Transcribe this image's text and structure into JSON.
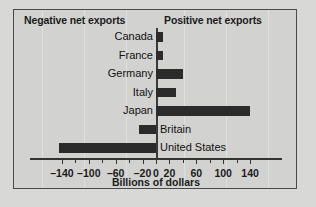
{
  "chart_data": {
    "type": "bar",
    "orientation": "horizontal",
    "title": "",
    "xlabel": "Billions of dollars",
    "ylabel": "",
    "xlim": [
      -150,
      150
    ],
    "grid": false,
    "legend": null,
    "categories": [
      "Canada",
      "France",
      "Germany",
      "Italy",
      "Japan",
      "Britain",
      "United States"
    ],
    "values": [
      10,
      10,
      40,
      30,
      140,
      -25,
      -145
    ],
    "tick_values": [
      -140,
      -100,
      -60,
      -20,
      0,
      20,
      60,
      100,
      140
    ],
    "tick_labels": [
      "–140",
      "–100",
      "–60",
      "–20",
      "0",
      "20",
      "60",
      "100",
      "140"
    ],
    "minor_tick_values": [
      -120,
      -80,
      -40,
      40,
      80,
      120
    ],
    "annotations": {
      "left_header": "Negative net exports",
      "right_header": "Positive net exports"
    },
    "colors": {
      "bar": "#2b2b2b",
      "background": "#d2d2d0",
      "axis": "#333333",
      "text": "#1b1b1b",
      "border": "#4a4a4a"
    }
  }
}
